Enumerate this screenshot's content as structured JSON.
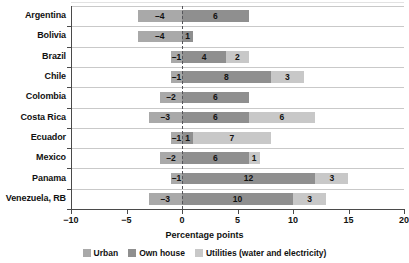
{
  "chart_data": {
    "type": "bar",
    "orientation": "horizontal",
    "stacked": true,
    "diverging": true,
    "title": "",
    "xlabel": "Percentage points",
    "ylabel": "",
    "xlim": [
      -10,
      20
    ],
    "xticks": [
      -10,
      -5,
      0,
      5,
      10,
      15,
      20
    ],
    "xtick_labels": [
      "−10",
      "−5",
      "0",
      "5",
      "10",
      "15",
      "20"
    ],
    "grid": true,
    "grid_axis": "y",
    "zero_line": "dashed",
    "legend_position": "bottom-center",
    "categories": [
      "Argentina",
      "Bolivia",
      "Brazil",
      "Chile",
      "Colombia",
      "Costa Rica",
      "Ecuador",
      "Mexico",
      "Panama",
      "Venezuela, RB"
    ],
    "series": [
      {
        "name": "Urban",
        "color": "#a9a9a9",
        "values": [
          -4,
          -4,
          -1,
          -1,
          -2,
          -3,
          -1,
          -2,
          -1,
          -3
        ],
        "labels": [
          "–4",
          "–4",
          "–1",
          "–1",
          "–2",
          "–3",
          "–1",
          "–2",
          "–1",
          "–3"
        ]
      },
      {
        "name": "Own house",
        "color": "#8f8f8f",
        "values": [
          6,
          1,
          4,
          8,
          6,
          6,
          1,
          6,
          12,
          10
        ],
        "labels": [
          "6",
          "1",
          "4",
          "8",
          "6",
          "6",
          "1",
          "6",
          "12",
          "10"
        ]
      },
      {
        "name": "Utilities (water and electricity)",
        "color": "#c8c8c8",
        "values": [
          0,
          0,
          2,
          3,
          0,
          6,
          7,
          1,
          3,
          3
        ],
        "labels": [
          "",
          "",
          "2",
          "3",
          "",
          "6",
          "7",
          "1",
          "3",
          "3"
        ]
      }
    ]
  },
  "legend": {
    "items": [
      {
        "label": "Urban",
        "color": "#a9a9a9"
      },
      {
        "label": "Own house",
        "color": "#8f8f8f"
      },
      {
        "label": "Utilities (water and electricity)",
        "color": "#c8c8c8"
      }
    ]
  },
  "axis": {
    "x_title": "Percentage points"
  }
}
